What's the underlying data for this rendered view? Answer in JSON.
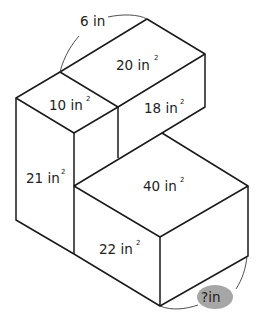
{
  "diagram": {
    "type": "composite-rectangular-prisms",
    "colors": {
      "edge": "#1a1a1a",
      "unknown_highlight": "#a6a6a6",
      "background": "#ffffff"
    },
    "dimension_labels": {
      "top_edge": {
        "value": "6",
        "unit": "in"
      },
      "bottom_edge": {
        "value": "?",
        "unit": "in"
      }
    },
    "face_labels": {
      "upper_top": {
        "value": "20",
        "unit": "in"
      },
      "upper_front": {
        "value": "18",
        "unit": "in"
      },
      "tall_top": {
        "value": "10",
        "unit": "in"
      },
      "tall_side": {
        "value": "21",
        "unit": "in"
      },
      "lower_top": {
        "value": "40",
        "unit": "in"
      },
      "lower_front": {
        "value": "22",
        "unit": "in"
      }
    },
    "superscript": "2"
  }
}
